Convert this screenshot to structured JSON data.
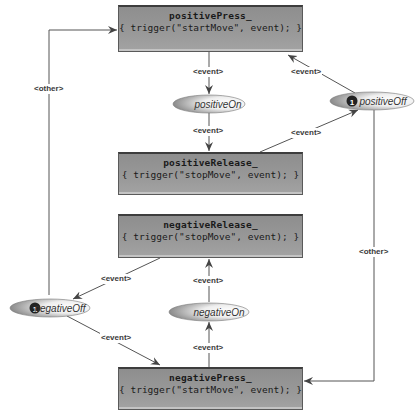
{
  "diagram": {
    "boxes": [
      {
        "id": "positivePress",
        "name": "positivePress_",
        "action": "{ trigger(\"startMove\", event); }"
      },
      {
        "id": "positiveRelease",
        "name": "positiveRelease_",
        "action": "{ trigger(\"stopMove\", event); }"
      },
      {
        "id": "negativeRelease",
        "name": "negativeRelease_",
        "action": "{ trigger(\"stopMove\", event); }"
      },
      {
        "id": "negativePress",
        "name": "negativePress_",
        "action": "{ trigger(\"startMove\", event); }"
      }
    ],
    "states": [
      {
        "id": "positiveOn",
        "label": "positiveOn",
        "initial": false
      },
      {
        "id": "positiveOff",
        "label": "positiveOff",
        "initial": true,
        "initial_marker": "1"
      },
      {
        "id": "negativeOn",
        "label": "negativeOn",
        "initial": false
      },
      {
        "id": "negativeOff",
        "label": "negativeOff",
        "initial": true,
        "initial_marker": "1"
      }
    ],
    "edge_labels": {
      "pp_to_pon": "<event>",
      "pon_to_pr": "<event>",
      "pr_to_poff": "<event>",
      "poff_to_pp": "<event>",
      "noff_to_pp": "<other>",
      "poff_to_np": "<other>",
      "nr_to_noff": "<event>",
      "noff_to_np": "<event>",
      "np_to_non": "<event>",
      "non_to_nr": "<event>"
    },
    "colors": {
      "box_fill": "#999999",
      "box_border": "#3d3d3d",
      "edge": "#555555",
      "ellipse_light": "#ffffff",
      "ellipse_dark": "#8a8a8a"
    }
  }
}
